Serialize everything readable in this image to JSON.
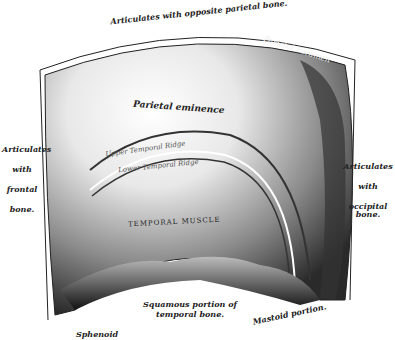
{
  "figure": {
    "labels": {
      "top": "Articulates with opposite parietal bone.",
      "foramen": "Parietal Foramen",
      "eminence": "Parietal eminence",
      "upper_ridge": "Upper Temporal Ridge",
      "lower_ridge": "Lower Temporal Ridge",
      "muscle": "TEMPORAL MUSCLE",
      "left": [
        "Articulates",
        "with",
        "frontal",
        "bone."
      ],
      "right": [
        "Articulates",
        "with",
        "occipital bone."
      ],
      "squamous": [
        "Squamous portion of",
        "temporal bone."
      ],
      "mastoid": "Mastoid portion.",
      "sphenoid": "Sphenoid"
    },
    "colors": {
      "ink": "#222222",
      "shade_dark": "#1a1a1a",
      "shade_mid": "#777777",
      "paper": "#ffffff"
    }
  }
}
